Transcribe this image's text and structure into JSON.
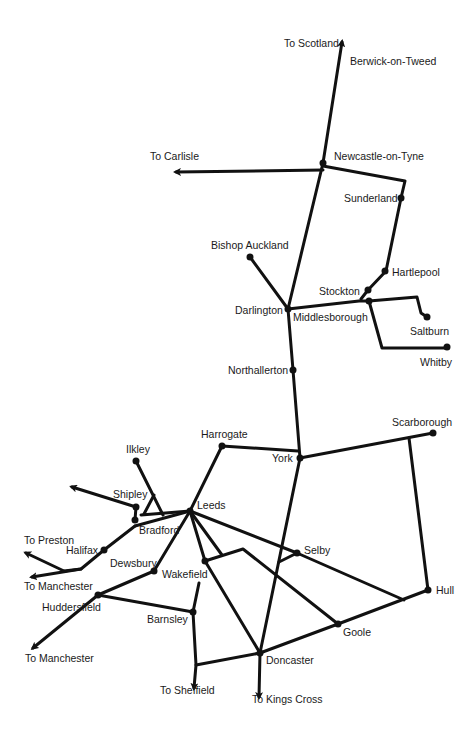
{
  "diagram": {
    "type": "railway-network-map",
    "colors": {
      "line": "#111111",
      "station": "#111111",
      "label": "#1a1a1a",
      "background": "#ffffff"
    },
    "stations": [
      {
        "id": "berwick",
        "label": "Berwick-on-Tweed",
        "x": 0,
        "y": 0,
        "dot": false
      },
      {
        "id": "newcastle",
        "label": "Newcastle-on-Tyne",
        "x": 323,
        "y": 163,
        "dot": true
      },
      {
        "id": "sunderland",
        "label": "Sunderland",
        "x": 401,
        "y": 198,
        "dot": true
      },
      {
        "id": "hartlepool",
        "label": "Hartlepool",
        "x": 385,
        "y": 271,
        "dot": true
      },
      {
        "id": "stockton",
        "label": "Stockton",
        "x": 368,
        "y": 290,
        "dot": true
      },
      {
        "id": "bishop_auckland",
        "label": "Bishop Auckland",
        "x": 250,
        "y": 257,
        "dot": true
      },
      {
        "id": "darlington",
        "label": "Darlington",
        "x": 288,
        "y": 309,
        "dot": true
      },
      {
        "id": "middlesborough",
        "label": "Middlesborough",
        "x": 369,
        "y": 301,
        "dot": true
      },
      {
        "id": "saltburn",
        "label": "Saltburn",
        "x": 427,
        "y": 317,
        "dot": true
      },
      {
        "id": "whitby",
        "label": "Whitby",
        "x": 447,
        "y": 347,
        "dot": true
      },
      {
        "id": "northallerton",
        "label": "Northallerton",
        "x": 293,
        "y": 370,
        "dot": true
      },
      {
        "id": "york",
        "label": "York",
        "x": 300,
        "y": 458,
        "dot": true
      },
      {
        "id": "scarborough",
        "label": "Scarborough",
        "x": 433,
        "y": 433,
        "dot": true
      },
      {
        "id": "harrogate",
        "label": "Harrogate",
        "x": 222,
        "y": 446,
        "dot": true
      },
      {
        "id": "ilkley",
        "label": "Ilkley",
        "x": 136,
        "y": 461,
        "dot": true
      },
      {
        "id": "shipley",
        "label": "Shipley",
        "x": 136,
        "y": 507,
        "dot": true
      },
      {
        "id": "leeds",
        "label": "Leeds",
        "x": 190,
        "y": 511,
        "dot": true
      },
      {
        "id": "bradford",
        "label": "Bradford",
        "x": 135,
        "y": 520,
        "dot": true
      },
      {
        "id": "halifax",
        "label": "Halifax",
        "x": 104,
        "y": 550,
        "dot": true
      },
      {
        "id": "dewsbury",
        "label": "Dewsbury",
        "x": 154,
        "y": 571,
        "dot": true
      },
      {
        "id": "wakefield",
        "label": "Wakefield",
        "x": 205,
        "y": 561,
        "dot": true
      },
      {
        "id": "selby",
        "label": "Selby",
        "x": 297,
        "y": 553,
        "dot": true
      },
      {
        "id": "huddersfield",
        "label": "Huddersfield",
        "x": 98,
        "y": 595,
        "dot": true
      },
      {
        "id": "barnsley",
        "label": "Barnsley",
        "x": 193,
        "y": 612,
        "dot": true
      },
      {
        "id": "hull",
        "label": "Hull",
        "x": 428,
        "y": 590,
        "dot": true
      },
      {
        "id": "goole",
        "label": "Goole",
        "x": 338,
        "y": 624,
        "dot": true
      },
      {
        "id": "doncaster",
        "label": "Doncaster",
        "x": 260,
        "y": 653,
        "dot": true
      }
    ],
    "destinations": [
      {
        "id": "to_scotland",
        "label": "To Scotland"
      },
      {
        "id": "to_carlisle",
        "label": "To Carlisle"
      },
      {
        "id": "to_preston",
        "label": "To Preston"
      },
      {
        "id": "to_manchester_1",
        "label": "To Manchester"
      },
      {
        "id": "to_manchester_2",
        "label": "To Manchester"
      },
      {
        "id": "to_sheffield",
        "label": "To Sheffield"
      },
      {
        "id": "to_kings_cross",
        "label": "To Kings Cross"
      }
    ]
  }
}
